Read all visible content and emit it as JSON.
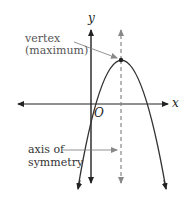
{
  "diagram": {
    "axes": {
      "x_label": "x",
      "y_label": "y",
      "origin_label": "O"
    },
    "annotations": {
      "vertex_line1": "vertex",
      "vertex_line2": "(maximum)",
      "axis_line1": "axis of",
      "axis_line2": "symmetry"
    },
    "colors": {
      "line": "#333333",
      "dashed": "#888888",
      "text": "#555555"
    }
  }
}
